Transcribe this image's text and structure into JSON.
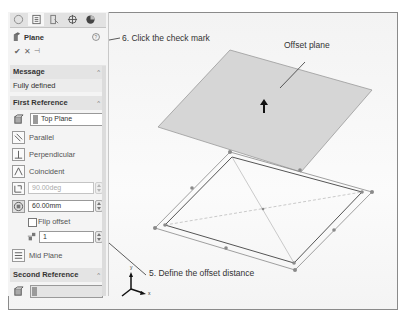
{
  "panel": {
    "tabs": [
      {
        "icon": "feature-manager-icon"
      },
      {
        "icon": "property-manager-icon"
      },
      {
        "icon": "configuration-manager-icon"
      },
      {
        "icon": "dimxpert-icon"
      },
      {
        "icon": "display-manager-icon"
      }
    ],
    "title": "Plane",
    "help_icon": "help-icon",
    "actions": {
      "ok": "✔",
      "cancel": "✕",
      "pushpin": "⊣"
    },
    "message": {
      "header": "Message",
      "text": "Fully defined"
    },
    "first_reference": {
      "header": "First Reference",
      "selection": "Top Plane",
      "options": [
        "Parallel",
        "Perpendicular",
        "Coincident"
      ],
      "angle_value": "90.00deg",
      "offset_value": "60.00mm",
      "flip_offset_label": "Flip offset",
      "instances_value": "1",
      "mid_plane_label": "Mid Plane"
    },
    "second_reference": {
      "header": "Second Reference",
      "selection": ""
    }
  },
  "callouts": {
    "check_mark": "6. Click the check mark",
    "offset_plane": "Offset plane",
    "offset_distance": "5. Define the offset distance"
  },
  "triad": {
    "x": "x",
    "y": "y"
  },
  "colors": {
    "plane_fill": "#d6d6d6",
    "panel_bg": "#f4f4f4",
    "section_bg": "#e4e4e4"
  }
}
